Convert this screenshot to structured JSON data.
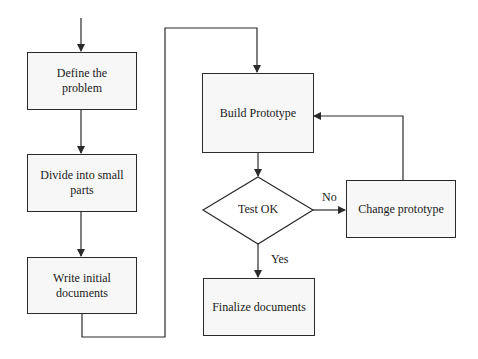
{
  "diagram": {
    "type": "flowchart",
    "nodes": {
      "define": {
        "label": "Define the problem",
        "shape": "rectangle"
      },
      "divide": {
        "label": "Divide into small parts",
        "shape": "rectangle"
      },
      "write": {
        "label": "Write initial documents",
        "shape": "rectangle"
      },
      "build": {
        "label": "Build Prototype",
        "shape": "rectangle"
      },
      "test": {
        "label": "Test OK",
        "shape": "diamond"
      },
      "change": {
        "label": "Change prototype",
        "shape": "rectangle"
      },
      "finalize": {
        "label": "Finalize documents",
        "shape": "rectangle"
      }
    },
    "edges": {
      "no_label": "No",
      "yes_label": "Yes"
    },
    "colors": {
      "stroke": "#2a2a2a",
      "fill": "#f7f7f7",
      "background": "#ffffff"
    }
  }
}
